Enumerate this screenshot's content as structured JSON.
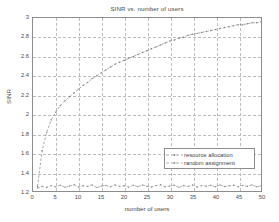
{
  "chart_data": {
    "type": "line",
    "title": "SINR vs. number of users",
    "xlabel": "number of users",
    "ylabel": "SINR",
    "xlim": [
      0,
      50
    ],
    "ylim": [
      1.2,
      3
    ],
    "xticks": [
      0,
      5,
      10,
      15,
      20,
      25,
      30,
      35,
      40,
      45,
      50
    ],
    "yticks": [
      "1.2",
      "1.4",
      "1.6",
      "1.8",
      "2",
      "2.2",
      "2.4",
      "2.6",
      "2.8",
      "3"
    ],
    "grid": true,
    "legend_position": "lower right",
    "series": [
      {
        "name": "resource allocation",
        "color": "#808080",
        "linestyle": "dashed",
        "marker": "dot",
        "x": [
          1,
          2,
          3,
          4,
          5,
          6,
          7,
          8,
          9,
          10,
          11,
          12,
          13,
          14,
          15,
          16,
          17,
          18,
          19,
          20,
          21,
          22,
          23,
          24,
          25,
          26,
          27,
          28,
          29,
          30,
          31,
          32,
          33,
          34,
          35,
          36,
          37,
          38,
          39,
          40,
          41,
          42,
          43,
          44,
          45,
          46,
          47,
          48,
          49,
          50
        ],
        "values": [
          1.25,
          1.62,
          1.81,
          1.94,
          2.02,
          2.09,
          2.14,
          2.18,
          2.22,
          2.26,
          2.3,
          2.33,
          2.37,
          2.4,
          2.43,
          2.46,
          2.49,
          2.52,
          2.54,
          2.56,
          2.58,
          2.6,
          2.62,
          2.64,
          2.66,
          2.68,
          2.7,
          2.72,
          2.74,
          2.76,
          2.77,
          2.79,
          2.8,
          2.82,
          2.83,
          2.84,
          2.85,
          2.86,
          2.87,
          2.88,
          2.89,
          2.9,
          2.91,
          2.92,
          2.93,
          2.93,
          2.94,
          2.95,
          2.95,
          2.96
        ]
      },
      {
        "name": "random assignment",
        "color": "#8f8f8f",
        "linestyle": "dashed",
        "marker": "dot",
        "x": [
          1,
          2,
          3,
          4,
          5,
          6,
          7,
          8,
          9,
          10,
          11,
          12,
          13,
          14,
          15,
          16,
          17,
          18,
          19,
          20,
          21,
          22,
          23,
          24,
          25,
          26,
          27,
          28,
          29,
          30,
          31,
          32,
          33,
          34,
          35,
          36,
          37,
          38,
          39,
          40,
          41,
          42,
          43,
          44,
          45,
          46,
          47,
          48,
          49,
          50
        ],
        "values": [
          1.232,
          1.247,
          1.238,
          1.256,
          1.243,
          1.261,
          1.239,
          1.252,
          1.264,
          1.241,
          1.255,
          1.247,
          1.262,
          1.236,
          1.251,
          1.258,
          1.243,
          1.263,
          1.248,
          1.254,
          1.24,
          1.259,
          1.246,
          1.262,
          1.25,
          1.242,
          1.257,
          1.264,
          1.245,
          1.253,
          1.261,
          1.238,
          1.255,
          1.248,
          1.263,
          1.241,
          1.256,
          1.25,
          1.259,
          1.244,
          1.262,
          1.247,
          1.254,
          1.26,
          1.243,
          1.257,
          1.249,
          1.263,
          1.245,
          1.252
        ]
      }
    ]
  },
  "legend": {
    "items": [
      {
        "label": "resource allocation"
      },
      {
        "label": "random assignment"
      }
    ]
  },
  "colors": {
    "axis": "#8d8d8d",
    "grid": "#bdbdbd",
    "text": "#4a4a4a",
    "series1": "#808080",
    "series2": "#8f8f8f"
  }
}
